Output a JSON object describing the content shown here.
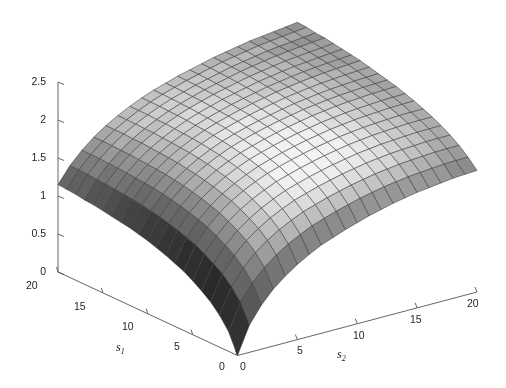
{
  "figure": {
    "width": 506,
    "height": 388,
    "background": "#ffffff",
    "line_color": "#3a3a3a",
    "axis_color": "#555555",
    "text_color": "#262626"
  },
  "axes": {
    "z": {
      "label": "",
      "ticks": [
        "0",
        "0.5",
        "1",
        "1.5",
        "2",
        "2.5"
      ],
      "tick_values": [
        0,
        0.5,
        1,
        1.5,
        2,
        2.5
      ],
      "range": [
        0,
        2.5
      ]
    },
    "s1": {
      "label": "s",
      "label_sub": "1",
      "ticks": [
        "20",
        "15",
        "10",
        "5",
        "0"
      ],
      "tick_values": [
        20,
        15,
        10,
        5,
        0
      ],
      "range": [
        0,
        20
      ]
    },
    "s2": {
      "label": "s",
      "label_sub": "2",
      "ticks": [
        "0",
        "5",
        "10",
        "15",
        "20"
      ],
      "tick_values": [
        0,
        5,
        10,
        15,
        20
      ],
      "range": [
        0,
        20
      ]
    }
  },
  "chart_data": {
    "type": "surface",
    "title": "",
    "xlabel": "s1",
    "ylabel": "s2",
    "zlabel": "",
    "xlim": [
      0,
      20
    ],
    "ylim": [
      0,
      20
    ],
    "zlim": [
      0,
      2.5
    ],
    "grid": true,
    "legend": false,
    "colormap": "gray",
    "mesh_n": 20,
    "x": [
      0,
      1,
      2,
      3,
      4,
      5,
      6,
      7,
      8,
      9,
      10,
      11,
      12,
      13,
      14,
      15,
      16,
      17,
      18,
      19,
      20
    ],
    "y": [
      0,
      1,
      2,
      3,
      4,
      5,
      6,
      7,
      8,
      9,
      10,
      11,
      12,
      13,
      14,
      15,
      16,
      17,
      18,
      19,
      20
    ],
    "z_corners": {
      "s1_0_s2_0": 0.0,
      "s1_20_s2_0": 1.15,
      "s1_0_s2_20": 1.6,
      "s1_20_s2_20": 2.45
    },
    "z_edge_s2_0": [
      0.0,
      0.26,
      0.42,
      0.54,
      0.63,
      0.71,
      0.78,
      0.83,
      0.88,
      0.92,
      0.96,
      0.99,
      1.02,
      1.04,
      1.06,
      1.08,
      1.1,
      1.11,
      1.13,
      1.14,
      1.15
    ],
    "z_edge_s1_0": [
      0.0,
      0.36,
      0.58,
      0.75,
      0.88,
      0.99,
      1.08,
      1.16,
      1.22,
      1.28,
      1.33,
      1.38,
      1.42,
      1.46,
      1.49,
      1.52,
      1.54,
      1.56,
      1.58,
      1.59,
      1.6
    ],
    "z_edge_s2_20": [
      1.6,
      1.72,
      1.82,
      1.9,
      1.97,
      2.03,
      2.08,
      2.13,
      2.17,
      2.21,
      2.24,
      2.27,
      2.3,
      2.33,
      2.35,
      2.37,
      2.39,
      2.41,
      2.42,
      2.44,
      2.45
    ],
    "z_edge_s1_20": [
      1.15,
      1.36,
      1.52,
      1.65,
      1.76,
      1.85,
      1.93,
      2.0,
      2.06,
      2.11,
      2.16,
      2.2,
      2.24,
      2.28,
      2.31,
      2.34,
      2.37,
      2.39,
      2.41,
      2.43,
      2.45
    ]
  },
  "view": {
    "azimuth_deg": -37.5,
    "elevation_deg": 30
  }
}
